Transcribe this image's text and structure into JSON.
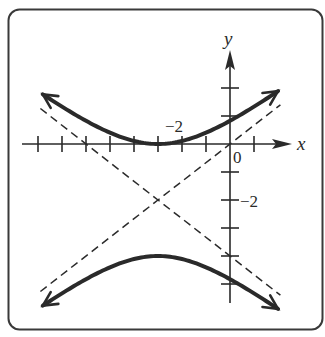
{
  "chart_data": {
    "type": "line",
    "title": "",
    "equation": "(y+2)^2/4 - (x+3)^2/9 = 1",
    "center": [
      -3,
      -2
    ],
    "vertices": [
      [
        -3,
        0
      ],
      [
        -3,
        -4
      ]
    ],
    "asymptotes": [
      {
        "slope": 0.6667,
        "point": [
          -3,
          -2
        ],
        "through": [
          0,
          0
        ],
        "style": "dashed"
      },
      {
        "slope": -0.6667,
        "point": [
          -3,
          -2
        ],
        "through": [
          0,
          -4
        ],
        "style": "dashed"
      }
    ],
    "series": [
      {
        "name": "upper branch",
        "x_range": [
          -7.8,
          2.0
        ],
        "style": "solid-thick",
        "arrows": "both"
      },
      {
        "name": "lower branch",
        "x_range": [
          -7.8,
          2.0
        ],
        "style": "solid-thick",
        "arrows": "both"
      }
    ],
    "xlabel": "x",
    "ylabel": "y",
    "xlim": [
      -8.5,
      2.5
    ],
    "ylim": [
      -5.6,
      3.4
    ],
    "x_ticks": [
      -8,
      -7,
      -6,
      -5,
      -4,
      -3,
      -2,
      -1,
      1
    ],
    "y_ticks": [
      2,
      1,
      -1,
      -2,
      -3,
      -4,
      -5
    ],
    "tick_labels": {
      "x": [
        {
          "value": -2,
          "label": "−2"
        }
      ],
      "y": [
        {
          "value": -2,
          "label": "−2"
        }
      ],
      "origin": "0"
    },
    "grid": false,
    "legend": null
  },
  "labels": {
    "x_axis": "x",
    "y_axis": "y",
    "origin": "0",
    "x_tick": "−2",
    "y_tick": "−2"
  },
  "colors": {
    "ink": "#2a2a2a",
    "frame": "#3a3a3a",
    "background": "#ffffff"
  }
}
